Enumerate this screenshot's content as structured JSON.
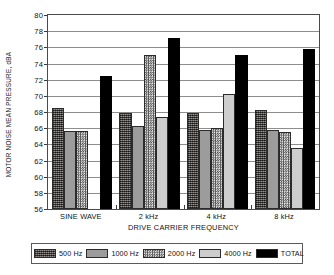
{
  "chart_data": {
    "type": "bar",
    "title": "",
    "xlabel": "DRIVE CARRIER FREQUENCY",
    "ylabel": "MOTOR NOISE MEAN PRESSURE, dBA",
    "categories": [
      "SINE WAVE",
      "2 kHz",
      "4 kHz",
      "8 kHz"
    ],
    "ylim": [
      56,
      80
    ],
    "yticks": [
      56,
      58,
      60,
      62,
      64,
      66,
      68,
      70,
      72,
      74,
      76,
      78,
      80
    ],
    "grid": true,
    "legend_position": "bottom",
    "series": [
      {
        "name": "500 Hz",
        "color": "#6e6a66",
        "pattern": "speckled",
        "values": [
          68.5,
          67.9,
          67.9,
          68.3
        ]
      },
      {
        "name": "1000 Hz",
        "color": "#9c9c9c",
        "pattern": "solid-gray",
        "values": [
          65.6,
          66.3,
          65.8,
          65.8
        ]
      },
      {
        "name": "2000 Hz",
        "color": "#d8d8d8",
        "pattern": "checkerboard",
        "values": [
          65.6,
          75.0,
          66.0,
          65.5
        ]
      },
      {
        "name": "4000 Hz",
        "color": "#cdcdcd",
        "pattern": "light-gray",
        "values": [
          56.0,
          67.4,
          70.2,
          63.5
        ]
      },
      {
        "name": "TOTAL",
        "color": "#000000",
        "pattern": "solid-black",
        "values": [
          72.5,
          77.1,
          75.0,
          75.8
        ]
      }
    ]
  },
  "legend": {
    "items": [
      {
        "label": "500 Hz"
      },
      {
        "label": "1000 Hz"
      },
      {
        "label": "2000 Hz"
      },
      {
        "label": "4000 Hz"
      },
      {
        "label": "TOTAL"
      }
    ]
  }
}
